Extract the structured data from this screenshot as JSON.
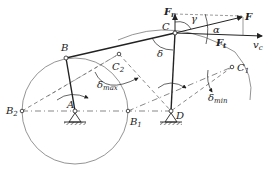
{
  "diagram": {
    "title": "",
    "type": "four-bar crank-rocker mechanism with transmission and pressure angles",
    "colors": {
      "line": "#222222",
      "dash": "#555555",
      "background": "#ffffff"
    },
    "points": {
      "A": {
        "label": "A",
        "x": 75,
        "y": 111
      },
      "B": {
        "label": "B",
        "x": 66,
        "y": 58
      },
      "C": {
        "label": "C",
        "x": 175,
        "y": 33
      },
      "D": {
        "label": "D",
        "x": 171,
        "y": 111
      },
      "B1": {
        "label": "B",
        "sub": "1",
        "x": 128,
        "y": 111
      },
      "B2": {
        "label": "B",
        "sub": "2",
        "x": 22,
        "y": 111
      },
      "C1": {
        "label": "C",
        "sub": "1",
        "x": 232,
        "y": 67
      },
      "C2": {
        "label": "C",
        "sub": "2",
        "x": 119,
        "y": 54
      }
    },
    "crank_circle_radius": 53,
    "forces": {
      "F": {
        "label": "F"
      },
      "Fn": {
        "label": "F",
        "sub": "n"
      },
      "Ft": {
        "label": "F",
        "sub": "t"
      },
      "vc": {
        "label": "v",
        "sub": "c"
      }
    },
    "angles": {
      "gamma": {
        "label": "γ"
      },
      "alpha": {
        "label": "α"
      },
      "delta": {
        "label": "δ"
      },
      "delta_max": {
        "label": "δ",
        "sub": "max"
      },
      "delta_min": {
        "label": "δ",
        "sub": "min"
      }
    }
  }
}
